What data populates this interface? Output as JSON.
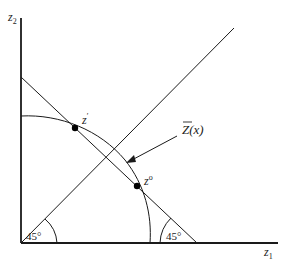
{
  "diagram": {
    "axes": {
      "x_label": "z",
      "x_label_sub": "1",
      "y_label": "z",
      "y_label_sub": "2"
    },
    "points": [
      {
        "name": "z-prime",
        "label": "z",
        "label_sup": "′"
      },
      {
        "name": "z-zero",
        "label": "z",
        "label_sup": "o"
      }
    ],
    "curve_label": "Z(x)",
    "angles": [
      {
        "label": "45°"
      },
      {
        "label": "45°"
      }
    ],
    "colors": {
      "line": "#1a1a1a",
      "background": "#ffffff"
    }
  }
}
